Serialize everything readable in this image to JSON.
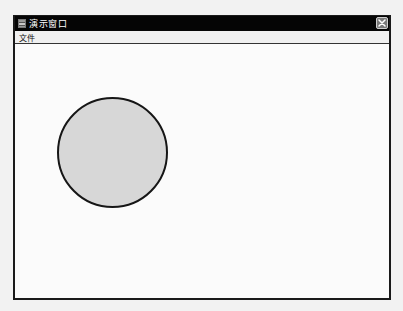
{
  "window": {
    "title": "演示窗口",
    "icon": "app-window-icon",
    "close_icon": "close-icon"
  },
  "menubar": {
    "items": [
      {
        "label": "文件"
      }
    ]
  },
  "canvas": {
    "shapes": [
      {
        "type": "circle",
        "fill": "#d7d7d7",
        "stroke": "#161616",
        "diameter_px": 111
      }
    ]
  },
  "colors": {
    "titlebar": "#050505",
    "title_text": "#ffffff",
    "close_button": "#7a7a7a",
    "menubar": "#f0f0f0",
    "canvas": "#fbfbfb"
  }
}
